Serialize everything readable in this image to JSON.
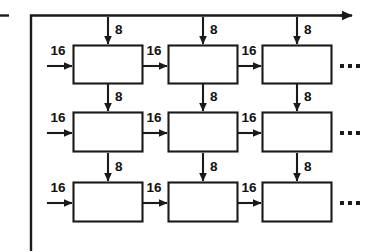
{
  "figure": {
    "background_color": "#ffffff",
    "line_color": "#1a1a1a",
    "width": 366,
    "height": 252
  },
  "bus": {
    "top_line_name": "top-horizontal-bus",
    "left_line_name": "left-vertical-bus",
    "left_stub_name": "left-edge-stub",
    "arrow_direction": "right"
  },
  "labels": {
    "horizontal_input": "16",
    "vertical_input": "8",
    "ellipsis": "…"
  },
  "grid": {
    "rows": 3,
    "cols": 3,
    "cell_label": "",
    "row_labels": [
      "16",
      "16",
      "16"
    ],
    "col_labels": [
      "8",
      "8",
      "8"
    ]
  },
  "cells": [
    [
      {
        "name": "pe-r1c1",
        "h_in": "16",
        "v_in": "8"
      },
      {
        "name": "pe-r1c2",
        "h_in": "16",
        "v_in": "8"
      },
      {
        "name": "pe-r1c3",
        "h_in": "16",
        "v_in": "8"
      }
    ],
    [
      {
        "name": "pe-r2c1",
        "h_in": "16",
        "v_in": "8"
      },
      {
        "name": "pe-r2c2",
        "h_in": "16",
        "v_in": "8"
      },
      {
        "name": "pe-r2c3",
        "h_in": "16",
        "v_in": "8"
      }
    ],
    [
      {
        "name": "pe-r3c1",
        "h_in": "16",
        "v_in": "8"
      },
      {
        "name": "pe-r3c2",
        "h_in": "16",
        "v_in": "8"
      },
      {
        "name": "pe-r3c3",
        "h_in": "16",
        "v_in": "8"
      }
    ]
  ],
  "row_continuation": [
    "…",
    "…",
    "…"
  ]
}
